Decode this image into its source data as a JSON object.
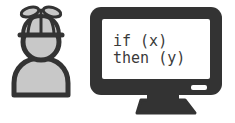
{
  "scene": {
    "title": "Person with propeller beanie facing a computer monitor",
    "background_color": "#ffffff",
    "width": 235,
    "height": 123
  },
  "colors": {
    "outline": "#333333",
    "fill_gray": "#c8c8c8",
    "fill_gray_dark": "#b4b4b4",
    "screen": "#ffffff",
    "text": "#3a3a3a",
    "led": "#ffffff"
  },
  "person": {
    "label": "programmer-figure",
    "beanie": {
      "label": "propeller-beanie",
      "propeller_blades": 2
    },
    "head": {
      "label": "head"
    },
    "body": {
      "label": "torso"
    }
  },
  "monitor": {
    "label": "computer-monitor",
    "bezel": {
      "label": "monitor-bezel"
    },
    "screen": {
      "label": "monitor-screen",
      "code_lines": [
        "if (x)",
        "then (y)"
      ]
    },
    "led": {
      "label": "power-led"
    },
    "stand": {
      "neck": {
        "label": "stand-neck"
      },
      "base": {
        "label": "stand-base"
      }
    }
  }
}
